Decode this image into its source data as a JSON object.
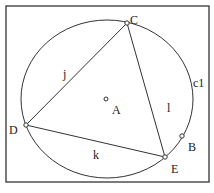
{
  "figure": {
    "circle_label": "c1",
    "center_label": "A",
    "points": {
      "B": "B",
      "C": "C",
      "D": "D",
      "E": "E"
    },
    "segments": {
      "j": "j",
      "k": "k",
      "l": "l"
    }
  },
  "colors": {
    "stroke": "#333333",
    "background": "#ffffff"
  }
}
